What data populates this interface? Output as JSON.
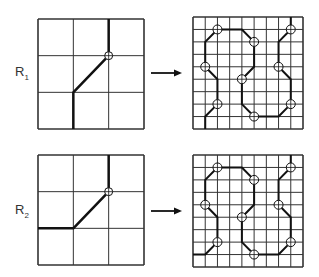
{
  "rows": [
    {
      "label": "R",
      "subscript": "1",
      "label_pos": {
        "x": 15,
        "y": 64
      },
      "small_grid": {
        "x": 38,
        "y": 19,
        "w": 106,
        "h": 110,
        "n": 3,
        "path": [
          [
            1,
            3
          ],
          [
            1,
            2
          ],
          [
            2,
            1
          ],
          [
            2,
            0
          ]
        ],
        "circles": [
          [
            2,
            1
          ]
        ]
      },
      "arrow": {
        "x1": 151,
        "x2": 182,
        "y": 73
      },
      "big_grid": {
        "x": 193,
        "y": 17,
        "w": 110,
        "h": 112,
        "n": 9,
        "path": [
          [
            1,
            9
          ],
          [
            1,
            8
          ],
          [
            2,
            7
          ],
          [
            2,
            5
          ],
          [
            1,
            4
          ],
          [
            1,
            2
          ],
          [
            2,
            1
          ],
          [
            4,
            1
          ],
          [
            5,
            2
          ],
          [
            5,
            4
          ],
          [
            4,
            5
          ],
          [
            4,
            7
          ],
          [
            5,
            8
          ],
          [
            7,
            8
          ],
          [
            8,
            7
          ],
          [
            8,
            5
          ],
          [
            7,
            4
          ],
          [
            7,
            2
          ],
          [
            8,
            1
          ],
          [
            8,
            0
          ]
        ],
        "circles": [
          [
            2,
            7
          ],
          [
            1,
            4
          ],
          [
            2,
            1
          ],
          [
            5,
            2
          ],
          [
            4,
            5
          ],
          [
            5,
            8
          ],
          [
            8,
            7
          ],
          [
            7,
            4
          ],
          [
            8,
            1
          ]
        ]
      }
    },
    {
      "label": "R",
      "subscript": "2",
      "label_pos": {
        "x": 15,
        "y": 202
      },
      "small_grid": {
        "x": 38,
        "y": 155,
        "w": 106,
        "h": 110,
        "n": 3,
        "path": [
          [
            0,
            2
          ],
          [
            1,
            2
          ],
          [
            2,
            1
          ],
          [
            2,
            0
          ]
        ],
        "circles": [
          [
            2,
            1
          ]
        ]
      },
      "arrow": {
        "x1": 151,
        "x2": 182,
        "y": 211
      },
      "big_grid": {
        "x": 193,
        "y": 155,
        "w": 110,
        "h": 112,
        "n": 9,
        "path": [
          [
            0,
            8
          ],
          [
            1,
            8
          ],
          [
            2,
            7
          ],
          [
            2,
            5
          ],
          [
            1,
            4
          ],
          [
            1,
            2
          ],
          [
            2,
            1
          ],
          [
            4,
            1
          ],
          [
            5,
            2
          ],
          [
            5,
            4
          ],
          [
            4,
            5
          ],
          [
            4,
            7
          ],
          [
            5,
            8
          ],
          [
            7,
            8
          ],
          [
            8,
            7
          ],
          [
            8,
            5
          ],
          [
            7,
            4
          ],
          [
            7,
            2
          ],
          [
            8,
            1
          ],
          [
            8,
            0
          ]
        ],
        "circles": [
          [
            2,
            7
          ],
          [
            1,
            4
          ],
          [
            2,
            1
          ],
          [
            5,
            2
          ],
          [
            4,
            5
          ],
          [
            5,
            8
          ],
          [
            8,
            7
          ],
          [
            7,
            4
          ],
          [
            8,
            1
          ]
        ]
      }
    }
  ],
  "colors": {
    "grid": "#333333",
    "path": "#111111",
    "background": "#ffffff"
  }
}
